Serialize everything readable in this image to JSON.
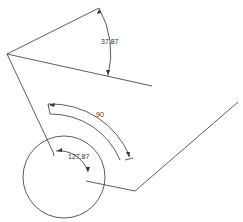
{
  "diagram": {
    "type": "cad-sketch",
    "dimensions": [
      {
        "id": "angle-top",
        "value": "37.87",
        "kind": "angle"
      },
      {
        "id": "arc-middle",
        "value": "90",
        "kind": "angle"
      },
      {
        "id": "angle-circle",
        "value": "127.87",
        "kind": "angle"
      }
    ],
    "colors": {
      "line": "#333333",
      "background": "#ffffff"
    }
  }
}
